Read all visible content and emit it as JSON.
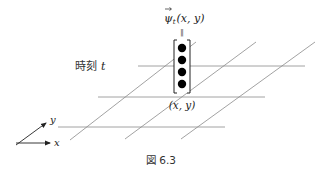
{
  "diagram": {
    "vector_label": "ψ",
    "vector_subscript": "t",
    "vector_args": "(x, y)",
    "equals_rotated": "‖",
    "time_label_jp": "時刻",
    "time_label_var": "t",
    "point_label": "(x, y)",
    "axis_x_label": "x",
    "axis_y_label": "y",
    "caption": "図 6.3",
    "vector_components": 4,
    "line_color": "#8a8a8a",
    "dot_color": "#000000"
  }
}
